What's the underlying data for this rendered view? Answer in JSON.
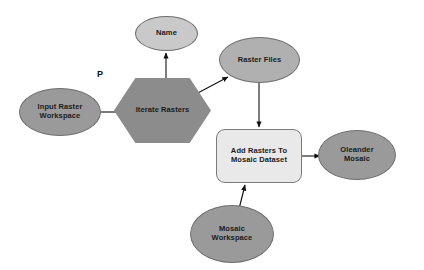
{
  "diagram": {
    "background_color": "#ffffff",
    "annotations": [
      {
        "id": "precondition-marker",
        "text": "P",
        "x": 97,
        "y": 69,
        "font_size": 9
      }
    ],
    "nodes": [
      {
        "id": "name-variable",
        "name": "node-name-variable",
        "label": "Name",
        "shape": "ellipse",
        "style": "ellipse-light",
        "fill": "#c9c9c9",
        "stroke": "#6e6e6e",
        "x": 135,
        "y": 16,
        "w": 63,
        "h": 35,
        "font_size": 7.5
      },
      {
        "id": "raster-files-variable",
        "name": "node-raster-files-variable",
        "label": "Raster Files",
        "shape": "ellipse",
        "style": "ellipse-mid",
        "fill": "#b0b0b0",
        "stroke": "#6e6e6e",
        "x": 219,
        "y": 37,
        "w": 81,
        "h": 46,
        "font_size": 7.5
      },
      {
        "id": "input-raster-workspace-variable",
        "name": "node-input-raster-workspace-variable",
        "label": "Input Raster\nWorkspace",
        "shape": "ellipse",
        "style": "ellipse-dark",
        "fill": "#9a9a9a",
        "stroke": "#6e6e6e",
        "x": 19,
        "y": 88,
        "w": 82,
        "h": 48,
        "font_size": 7.5
      },
      {
        "id": "iterate-rasters-iterator",
        "name": "node-iterate-rasters-iterator",
        "label": "Iterate Rasters",
        "shape": "hexagon",
        "style": "hexagon",
        "fill": "#8c8c8c",
        "stroke": "#8c8c8c",
        "x": 114,
        "y": 78,
        "w": 97,
        "h": 65,
        "font_size": 7.5
      },
      {
        "id": "add-rasters-tool",
        "name": "node-add-rasters-to-mosaic-dataset-tool",
        "label": "Add Rasters To\nMosaic Dataset",
        "shape": "roundrect",
        "style": "roundrect",
        "fill": "#e9e9e9",
        "stroke": "#7a7a7a",
        "x": 216,
        "y": 129,
        "w": 86,
        "h": 54,
        "font_size": 7.5
      },
      {
        "id": "oleander-mosaic-output",
        "name": "node-oleander-mosaic-output",
        "label": "Oleander\nMosaic",
        "shape": "ellipse",
        "style": "ellipse-dark",
        "fill": "#9a9a9a",
        "stroke": "#6e6e6e",
        "x": 318,
        "y": 130,
        "w": 78,
        "h": 50,
        "font_size": 7.5
      },
      {
        "id": "mosaic-workspace-variable",
        "name": "node-mosaic-workspace-variable",
        "label": "Mosaic\nWorkspace",
        "shape": "ellipse",
        "style": "ellipse-dark",
        "fill": "#9a9a9a",
        "stroke": "#6e6e6e",
        "x": 190,
        "y": 205,
        "w": 84,
        "h": 58,
        "font_size": 7.5
      }
    ],
    "edges": [
      {
        "id": "edge-input-to-iterate",
        "name": "edge-input-raster-workspace-to-iterate-rasters",
        "from": "input-raster-workspace-variable",
        "to": "iterate-rasters-iterator",
        "path": "M 101,112 L 130,112",
        "color": "#111111"
      },
      {
        "id": "edge-iterate-to-name",
        "name": "edge-iterate-rasters-to-name",
        "from": "iterate-rasters-iterator",
        "to": "name-variable",
        "path": "M 166,93 L 166,53",
        "color": "#111111"
      },
      {
        "id": "edge-iterate-to-raster-files",
        "name": "edge-iterate-rasters-to-raster-files",
        "from": "iterate-rasters-iterator",
        "to": "raster-files-variable",
        "path": "M 194,95 L 228,77",
        "color": "#111111"
      },
      {
        "id": "edge-raster-files-to-add-rasters",
        "name": "edge-raster-files-to-add-rasters-tool",
        "from": "raster-files-variable",
        "to": "add-rasters-tool",
        "path": "M 259,83 L 259,127",
        "color": "#111111"
      },
      {
        "id": "edge-mosaic-workspace-to-add-rasters",
        "name": "edge-mosaic-workspace-to-add-rasters-tool",
        "from": "mosaic-workspace-variable",
        "to": "add-rasters-tool",
        "path": "M 239,209 L 245,185",
        "color": "#111111"
      },
      {
        "id": "edge-add-rasters-to-oleander",
        "name": "edge-add-rasters-tool-to-oleander-mosaic",
        "from": "add-rasters-tool",
        "to": "oleander-mosaic-output",
        "path": "M 302,156 L 320,156",
        "color": "#111111"
      }
    ]
  }
}
